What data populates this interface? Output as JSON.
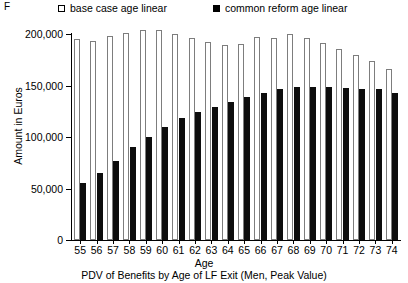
{
  "panel": {
    "letter": "F"
  },
  "legend": {
    "items": [
      {
        "label": "base case age linear",
        "marker": "open-square",
        "color": "#ffffff"
      },
      {
        "label": "common reform age linear",
        "marker": "filled-square",
        "color": "#000000"
      }
    ]
  },
  "axes": {
    "ylabel": "Amount in Euros",
    "xlabel": "Age",
    "yticks": [
      "0",
      "50,000",
      "100,000",
      "150,000",
      "200,000"
    ]
  },
  "caption": "PDV of Benefits by Age of LF Exit (Men, Peak Value)",
  "chart_data": {
    "type": "bar",
    "title": "PDV of Benefits by Age of LF Exit (Men, Peak Value)",
    "xlabel": "Age",
    "ylabel": "Amount in Euros",
    "ylim": [
      0,
      200000
    ],
    "yticks": [
      0,
      50000,
      100000,
      150000,
      200000
    ],
    "grid": false,
    "legend_position": "top",
    "categories": [
      "55",
      "56",
      "57",
      "58",
      "59",
      "60",
      "61",
      "62",
      "63",
      "64",
      "65",
      "66",
      "67",
      "68",
      "69",
      "70",
      "71",
      "72",
      "73",
      "74"
    ],
    "series": [
      {
        "name": "base case age linear",
        "color": "#ffffff",
        "values": [
          195000,
          193000,
          198000,
          201000,
          204000,
          204000,
          200000,
          196000,
          192000,
          189000,
          190000,
          197000,
          196000,
          200000,
          196000,
          191000,
          185000,
          180000,
          174000,
          166000
        ]
      },
      {
        "name": "common reform age linear",
        "color": "#000000",
        "values": [
          55000,
          65000,
          77000,
          90000,
          100000,
          110000,
          118000,
          124000,
          129000,
          134000,
          139000,
          143000,
          147000,
          149000,
          149000,
          149000,
          148000,
          147000,
          147000,
          143000
        ]
      }
    ]
  }
}
